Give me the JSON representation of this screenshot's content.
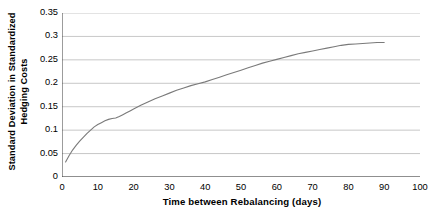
{
  "chart_data": {
    "type": "line",
    "title": "",
    "subtitle": "",
    "xlabel": "Time between Rebalancing (days)",
    "ylabel": "Standard Deviation in Standardized Hedging Costs",
    "ylabel_lines": [
      "Standard Deviation in Standardized",
      "Hedging Costs"
    ],
    "xlim": [
      0,
      100
    ],
    "ylim": [
      0,
      0.35
    ],
    "xticks": [
      0,
      10,
      20,
      30,
      40,
      50,
      60,
      70,
      80,
      90,
      100
    ],
    "xtick_labels": [
      "0",
      "10",
      "20",
      "30",
      "40",
      "50",
      "60",
      "70",
      "80",
      "90",
      "100"
    ],
    "yticks": [
      0,
      0.05,
      0.1,
      0.15,
      0.2,
      0.25,
      0.3,
      0.35
    ],
    "ytick_labels": [
      "0",
      "0.05",
      "0.1",
      "0.15",
      "0.2",
      "0.25",
      "0.3",
      "0.35"
    ],
    "grid": "horizontal",
    "legend": null,
    "legend_position": "none",
    "series": [
      {
        "name": "Standard Deviation in Standardized Hedging Costs",
        "color": "#7a7a7a",
        "line_width": 1.1,
        "x": [
          1,
          2,
          3,
          4,
          5,
          6,
          7,
          8,
          9,
          10,
          11,
          12,
          13,
          14,
          15,
          16,
          17,
          18,
          19,
          20,
          22,
          24,
          26,
          28,
          30,
          32,
          34,
          36,
          38,
          40,
          42,
          44,
          46,
          48,
          50,
          52,
          54,
          56,
          58,
          60,
          62,
          64,
          66,
          68,
          70,
          72,
          74,
          76,
          78,
          80,
          82,
          84,
          86,
          88,
          90
        ],
        "y": [
          0.032,
          0.046,
          0.058,
          0.068,
          0.077,
          0.085,
          0.093,
          0.1,
          0.107,
          0.112,
          0.116,
          0.12,
          0.123,
          0.125,
          0.126,
          0.129,
          0.133,
          0.137,
          0.141,
          0.145,
          0.153,
          0.16,
          0.167,
          0.173,
          0.179,
          0.185,
          0.19,
          0.195,
          0.199,
          0.203,
          0.208,
          0.213,
          0.218,
          0.223,
          0.228,
          0.233,
          0.238,
          0.243,
          0.247,
          0.251,
          0.255,
          0.259,
          0.263,
          0.266,
          0.269,
          0.272,
          0.275,
          0.278,
          0.281,
          0.283,
          0.284,
          0.285,
          0.286,
          0.287,
          0.287
        ]
      }
    ]
  },
  "style": {
    "background": "#ffffff",
    "axis_color": "#3a3a3a",
    "grid_color": "#b9b9b9",
    "text_color": "#000000",
    "series_color": "#7a7a7a"
  }
}
